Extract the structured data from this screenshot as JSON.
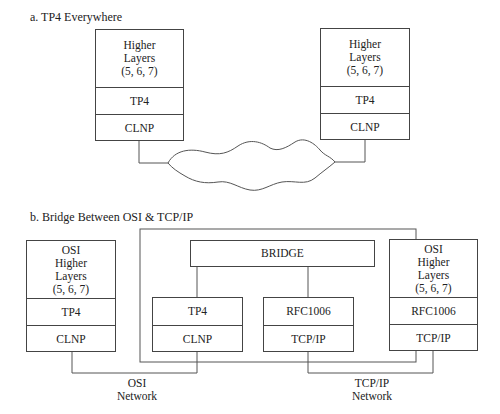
{
  "part_a": {
    "title": "a. TP4 Everywhere",
    "left_stack": {
      "higher": [
        "Higher",
        "Layers",
        "(5, 6, 7)"
      ],
      "transport": "TP4",
      "network": "CLNP"
    },
    "right_stack": {
      "higher": [
        "Higher",
        "Layers",
        "(5, 6, 7)"
      ],
      "transport": "TP4",
      "network": "CLNP"
    },
    "cloud": "network-cloud"
  },
  "part_b": {
    "title": "b. Bridge Between OSI & TCP/IP",
    "left_stack": {
      "higher": [
        "OSI",
        "Higher",
        "Layers",
        "(5, 6, 7)"
      ],
      "transport": "TP4",
      "network": "CLNP"
    },
    "bridge": {
      "label": "BRIDGE",
      "osi_side": {
        "transport": "TP4",
        "network": "CLNP"
      },
      "tcp_side": {
        "transport": "RFC1006",
        "network": "TCP/IP"
      }
    },
    "right_stack": {
      "higher": [
        "OSI",
        "Higher",
        "Layers",
        "(5, 6, 7)"
      ],
      "transport": "RFC1006",
      "network": "TCP/IP"
    },
    "osi_network_label": [
      "OSI",
      "Network"
    ],
    "tcpip_network_label": [
      "TCP/IP",
      "Network"
    ]
  }
}
